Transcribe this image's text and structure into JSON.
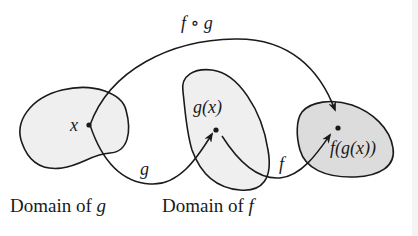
{
  "diagram": {
    "labels": {
      "composition": "f ∘ g",
      "x": "x",
      "g_of_x": "g(x)",
      "f_of_g_of_x": "f(g(x))",
      "arrow_g": "g",
      "arrow_f": "f"
    },
    "captions": {
      "domain_g_prefix": "Domain of ",
      "domain_g_var": "g",
      "domain_f_prefix": "Domain of ",
      "domain_f_var": "f"
    },
    "colors": {
      "stroke": "#1a1a1a",
      "region_light": "#efefef",
      "region_mid": "#e6e6e6",
      "region_dark": "#dcdcdc",
      "background": "#ffffff"
    }
  }
}
